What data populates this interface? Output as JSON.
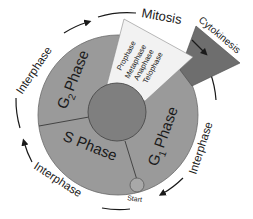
{
  "diagram": {
    "type": "cell-cycle",
    "phases": {
      "g2": {
        "main": "G",
        "sub": "2",
        "suffix": "Phase"
      },
      "s": {
        "label": "S Phase"
      },
      "g1": {
        "main": "G",
        "sub": "1",
        "suffix": "Phase"
      }
    },
    "mitosis": {
      "title": "Mitosis",
      "stages": [
        "Prophase",
        "Metaphase",
        "Anaphase",
        "Telophase"
      ]
    },
    "cytokinesis": {
      "label": "Cytokinesis"
    },
    "start": {
      "label": "Start"
    },
    "interphase_labels": [
      "Interphase",
      "Interphase",
      "Interphase"
    ],
    "colors": {
      "ring": "#9a9a9a",
      "inner_circle": "#7f7f7f",
      "mitosis_wedge": "#f2f2f2",
      "cytokinesis_wedge": "#6e6e6e",
      "start_circle": "#a8a8a8",
      "lines": "#3a3a3a",
      "text": "#1a1a1a"
    }
  }
}
